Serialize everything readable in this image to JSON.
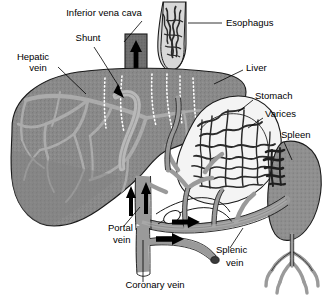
{
  "diagram": {
    "background_color": "#ffffff",
    "text_color": "#000000",
    "palette": {
      "liver_fill": "#8a8a8a",
      "liver_vessel": "#ababab",
      "shunt": "#b4b4b4",
      "ivc_fill": "#6e6e6e",
      "spleen_fill": "#8f8f8f",
      "vessel_gray": "#9a9a9a",
      "outline": "#1a1a1a",
      "varices": "#2b2b2b"
    },
    "labels": [
      {
        "id": "inferior-vena-cava",
        "text": "Inferior vena cava",
        "x": 104,
        "y": 16,
        "anchor": "middle"
      },
      {
        "id": "shunt",
        "text": "Shunt",
        "x": 88,
        "y": 41,
        "anchor": "middle"
      },
      {
        "id": "hepatic-vein-line1",
        "text": "Hepatic",
        "x": 33,
        "y": 60,
        "anchor": "middle"
      },
      {
        "id": "hepatic-vein-line2",
        "text": "vein",
        "x": 38,
        "y": 71,
        "anchor": "middle"
      },
      {
        "id": "esophagus",
        "text": "Esophagus",
        "x": 226,
        "y": 26,
        "anchor": "start"
      },
      {
        "id": "liver",
        "text": "Liver",
        "x": 246,
        "y": 71,
        "anchor": "start"
      },
      {
        "id": "stomach",
        "text": "Stomach",
        "x": 255,
        "y": 99,
        "anchor": "start"
      },
      {
        "id": "varices",
        "text": "Varices",
        "x": 265,
        "y": 117,
        "anchor": "start"
      },
      {
        "id": "spleen",
        "text": "Spleen",
        "x": 281,
        "y": 138,
        "anchor": "start"
      },
      {
        "id": "portal-vein-line1",
        "text": "Portal",
        "x": 108,
        "y": 231,
        "anchor": "start"
      },
      {
        "id": "portal-vein-line2",
        "text": "vein",
        "x": 113,
        "y": 243,
        "anchor": "start"
      },
      {
        "id": "splenic-vein-line1",
        "text": "Splenic",
        "x": 216,
        "y": 253,
        "anchor": "start"
      },
      {
        "id": "splenic-vein-line2",
        "text": "vein",
        "x": 226,
        "y": 266,
        "anchor": "start"
      },
      {
        "id": "coronary-vein",
        "text": "Coronary vein",
        "x": 155,
        "y": 288,
        "anchor": "middle"
      }
    ],
    "flow_arrows": [
      {
        "id": "ivc-upward-flow",
        "direction": "up",
        "location": "inferior vena cava"
      },
      {
        "id": "portal-inflow-left",
        "direction": "up",
        "location": "portal vein"
      },
      {
        "id": "portal-inflow-right",
        "direction": "up",
        "location": "portal vein"
      },
      {
        "id": "coronary-vein-flow",
        "direction": "left",
        "location": "coronary vein"
      },
      {
        "id": "splenic-flow",
        "direction": "left",
        "location": "splenic vein"
      },
      {
        "id": "shunt-pointer",
        "direction": "down-right",
        "location": "shunt"
      }
    ]
  }
}
